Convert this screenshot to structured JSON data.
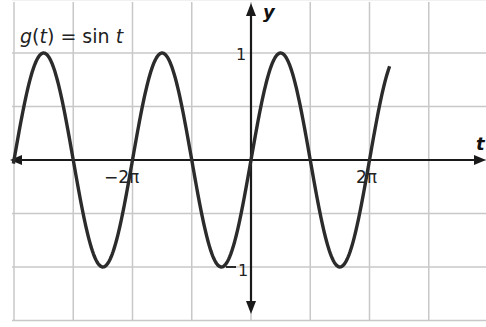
{
  "chart_data": {
    "type": "line",
    "title": "g(t) = sin t",
    "title_parts": {
      "fn": "g",
      "arg": "t",
      "eq": " = sin ",
      "var": "t"
    },
    "xlabel": "t",
    "ylabel": "y",
    "x_tick_labels": [
      {
        "value": -6.2832,
        "label": "−2π"
      },
      {
        "value": 6.2832,
        "label": "2π"
      }
    ],
    "y_tick_labels": [
      {
        "value": 1,
        "label": "1"
      },
      {
        "value": -1,
        "label": "−1"
      }
    ],
    "xlim": [
      -12.7,
      7.4
    ],
    "ylim": [
      -1.5,
      1.5
    ],
    "grid": true,
    "grid_x_step": "π",
    "grid_y_step": 0.5,
    "series": [
      {
        "name": "g(t) = sin t",
        "function": "sin(t)",
        "x_range": [
          -12.6,
          7.35
        ],
        "amplitude": 1,
        "period": "2π"
      }
    ],
    "sample_points": [
      {
        "t": -12.566,
        "y": 0
      },
      {
        "t": -10.996,
        "y": 1
      },
      {
        "t": -9.425,
        "y": 0
      },
      {
        "t": -7.854,
        "y": -1
      },
      {
        "t": -6.283,
        "y": 0
      },
      {
        "t": -4.712,
        "y": 1
      },
      {
        "t": -3.142,
        "y": 0
      },
      {
        "t": -1.571,
        "y": -1
      },
      {
        "t": 0,
        "y": 0
      },
      {
        "t": 1.571,
        "y": 1
      },
      {
        "t": 3.142,
        "y": 0
      },
      {
        "t": 4.712,
        "y": -1
      },
      {
        "t": 6.283,
        "y": 0
      },
      {
        "t": 7.854,
        "y": 1
      }
    ]
  },
  "labels": {
    "x_axis": "t",
    "y_axis": "y",
    "neg_two_pi": "−2π",
    "two_pi": "2π",
    "one": "1",
    "neg_one_digit": "1"
  },
  "colors": {
    "curve": "#2b2b2b",
    "axis": "#1a1a1a",
    "grid": "#c8c8c8"
  }
}
